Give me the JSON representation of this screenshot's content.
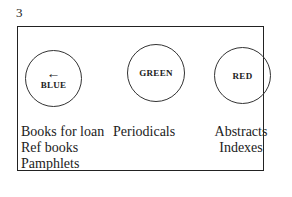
{
  "figure_number": "3",
  "zones": [
    {
      "color_label": "BLUE",
      "icon": "arrow-left-icon",
      "arrow_glyph": "←",
      "items": [
        "Books for loan",
        "Ref books",
        "Pamphlets"
      ]
    },
    {
      "color_label": "GREEN",
      "items": [
        "Periodicals"
      ]
    },
    {
      "color_label": "RED",
      "items": [
        "Abstracts",
        "Indexes"
      ]
    }
  ]
}
